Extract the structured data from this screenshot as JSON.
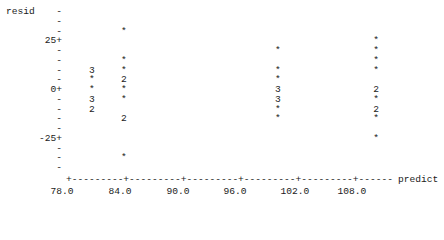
{
  "chart_data": {
    "type": "scatter",
    "style": "text-plot",
    "title": "",
    "xlabel": "predict",
    "ylabel": "resid",
    "x_ticks": [
      "78.0",
      "84.0",
      "90.0",
      "96.0",
      "102.0",
      "108.0"
    ],
    "y_ticks": [
      "25+",
      "0+",
      "-25+"
    ],
    "xlim": [
      78.0,
      112.0
    ],
    "ylim": [
      -40,
      40
    ],
    "legend": "symbols: * = 1 obs, digit = number of coincident obs",
    "points": [
      {
        "x": 80.7,
        "y": 10,
        "symbol": "3"
      },
      {
        "x": 80.7,
        "y": 5,
        "symbol": "*"
      },
      {
        "x": 80.7,
        "y": 0,
        "symbol": "*"
      },
      {
        "x": 80.7,
        "y": -5,
        "symbol": "3"
      },
      {
        "x": 80.7,
        "y": -10,
        "symbol": "2"
      },
      {
        "x": 84.0,
        "y": 30,
        "symbol": "*"
      },
      {
        "x": 84.0,
        "y": 15,
        "symbol": "*"
      },
      {
        "x": 84.0,
        "y": 10,
        "symbol": "*"
      },
      {
        "x": 84.0,
        "y": 5,
        "symbol": "2"
      },
      {
        "x": 84.0,
        "y": 0,
        "symbol": "*"
      },
      {
        "x": 84.0,
        "y": -5,
        "symbol": "*"
      },
      {
        "x": 84.0,
        "y": -15,
        "symbol": "2"
      },
      {
        "x": 84.0,
        "y": -35,
        "symbol": "*"
      },
      {
        "x": 100.0,
        "y": 20,
        "symbol": "*"
      },
      {
        "x": 100.0,
        "y": 10,
        "symbol": "*"
      },
      {
        "x": 100.0,
        "y": 5,
        "symbol": "*"
      },
      {
        "x": 100.0,
        "y": 0,
        "symbol": "3"
      },
      {
        "x": 100.0,
        "y": -5,
        "symbol": "3"
      },
      {
        "x": 100.0,
        "y": -10,
        "symbol": "*"
      },
      {
        "x": 100.0,
        "y": -15,
        "symbol": "*"
      },
      {
        "x": 110.2,
        "y": 25,
        "symbol": "*"
      },
      {
        "x": 110.2,
        "y": 20,
        "symbol": "*"
      },
      {
        "x": 110.2,
        "y": 15,
        "symbol": "*"
      },
      {
        "x": 110.2,
        "y": 10,
        "symbol": "*"
      },
      {
        "x": 110.2,
        "y": 0,
        "symbol": "2"
      },
      {
        "x": 110.2,
        "y": -5,
        "symbol": "*"
      },
      {
        "x": 110.2,
        "y": -10,
        "symbol": "2"
      },
      {
        "x": 110.2,
        "y": -15,
        "symbol": "*"
      },
      {
        "x": 110.2,
        "y": -25,
        "symbol": "*"
      }
    ]
  },
  "plot": {
    "ylabel": "resid",
    "xlabel": "predict",
    "y_tick_25": "25+",
    "y_tick_0": "0+",
    "y_tick_m25": "-25+",
    "y_minor": "-",
    "x_axis_line": "+---------+---------+---------+---------+---------+------",
    "x_ticks": [
      "78.0",
      "84.0",
      "90.0",
      "96.0",
      "102.0",
      "108.0"
    ]
  }
}
